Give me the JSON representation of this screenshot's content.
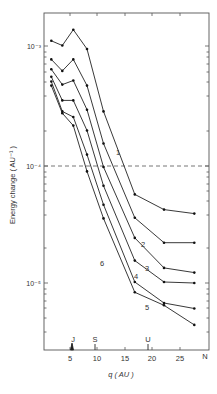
{
  "chart_data": {
    "type": "line",
    "title": "",
    "xlabel": "q (AU)",
    "ylabel": "Energy change (AU⁻¹)",
    "yscale": "log",
    "xlim": [
      0,
      30
    ],
    "ylim": [
      2.7e-06,
      0.0022
    ],
    "x_ticks": [
      5,
      10,
      15,
      20,
      25
    ],
    "x_tick_labels": [
      "5",
      "10",
      "15",
      "20",
      "25"
    ],
    "y_ticks": [
      0.001,
      0.0001,
      1e-05
    ],
    "y_tick_labels": [
      "10⁻³",
      "10⁻⁴",
      "10⁻⁵"
    ],
    "grid": false,
    "reference_line": {
      "y": 0.0001,
      "style": "dashed"
    },
    "planet_markers": [
      {
        "label": "J",
        "q": 5.2
      },
      {
        "label": "S",
        "q": 9.5
      },
      {
        "label": "U",
        "q": 19.2
      },
      {
        "label": "N",
        "q": 30.1
      }
    ],
    "x": [
      1.5,
      3.5,
      5.5,
      8,
      11,
      16.7,
      22,
      27.5
    ],
    "series": [
      {
        "name": "1",
        "values": [
          0.00115,
          0.00105,
          0.00143,
          0.00098,
          0.00029,
          5.75e-05,
          4.27e-05,
          3.95e-05
        ]
      },
      {
        "name": "2",
        "values": [
          0.0008,
          0.00064,
          0.0008,
          0.00048,
          0.000155,
          3.64e-05,
          2.24e-05,
          2.24e-05
        ]
      },
      {
        "name": "3",
        "values": [
          0.00066,
          0.00049,
          0.00053,
          0.0003,
          9.8e-05,
          2.46e-05,
          1.37e-05,
          1.25e-05
        ]
      },
      {
        "name": "4",
        "values": [
          0.00057,
          0.00036,
          0.00036,
          0.0002,
          6.8e-05,
          1.58e-05,
          1.04e-05,
          1.02e-05
        ]
      },
      {
        "name": "5",
        "values": [
          0.00052,
          0.00029,
          0.00026,
          0.000125,
          4.7e-05,
          1.04e-05,
          6.9e-06,
          6.2e-06
        ]
      },
      {
        "name": "6",
        "values": [
          0.00048,
          0.00028,
          0.00022,
          9e-05,
          3.6e-05,
          8.5e-06,
          6.6e-06,
          4.5e-06
        ]
      }
    ]
  },
  "labels": {
    "y_axis": "Energy change ( AU⁻¹ )",
    "x_axis": "q ( AU )",
    "tick_1e3": "10⁻³",
    "tick_1e4": "10⁻⁴",
    "tick_1e5": "10⁻⁵",
    "x5": "5",
    "x10": "10",
    "x15": "15",
    "x20": "20",
    "x25": "25",
    "J": "J",
    "S": "S",
    "U": "U",
    "N": "N",
    "c1": "1",
    "c2": "2",
    "c3": "3",
    "c4": "4",
    "c5": "5",
    "c6": "6"
  }
}
